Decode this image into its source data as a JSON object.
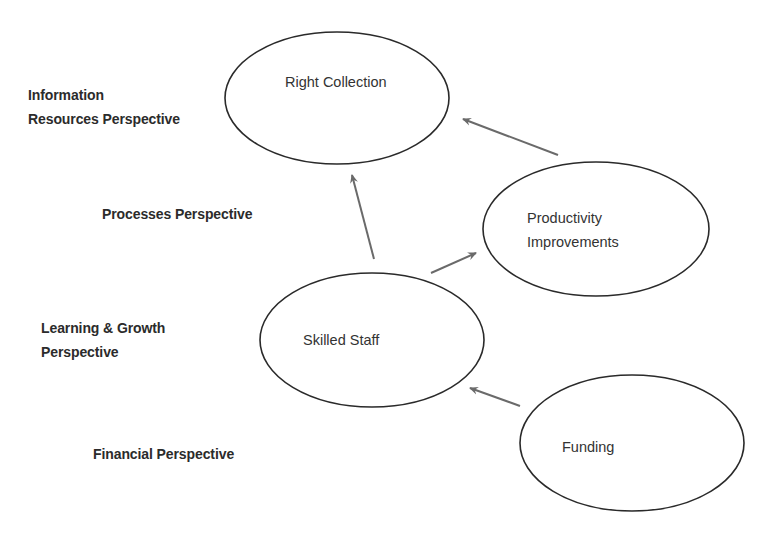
{
  "diagram": {
    "type": "strategy-map",
    "perspectives": [
      {
        "id": "information",
        "label": "Information\nResources Perspective"
      },
      {
        "id": "processes",
        "label": "Processes Perspective"
      },
      {
        "id": "learning",
        "label": "Learning & Growth\nPerspective"
      },
      {
        "id": "financial",
        "label": "Financial Perspective"
      }
    ],
    "nodes": [
      {
        "id": "right-collection",
        "label": "Right Collection",
        "perspective": "information"
      },
      {
        "id": "productivity",
        "label": "Productivity\nImprovements",
        "perspective": "processes"
      },
      {
        "id": "skilled-staff",
        "label": "Skilled Staff",
        "perspective": "learning"
      },
      {
        "id": "funding",
        "label": "Funding",
        "perspective": "financial"
      }
    ],
    "edges": [
      {
        "from": "funding",
        "to": "skilled-staff"
      },
      {
        "from": "skilled-staff",
        "to": "right-collection"
      },
      {
        "from": "skilled-staff",
        "to": "productivity"
      },
      {
        "from": "productivity",
        "to": "right-collection"
      }
    ],
    "colors": {
      "outline": "#2a2a2a",
      "arrow": "#6a6a6a",
      "text": "#2e2e2e",
      "background": "#ffffff"
    }
  }
}
